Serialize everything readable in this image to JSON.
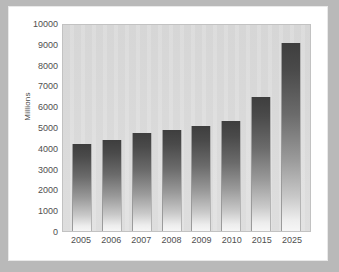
{
  "chart_data": {
    "type": "bar",
    "title": "",
    "xlabel": "",
    "ylabel": "Millions",
    "categories": [
      "2005",
      "2006",
      "2007",
      "2008",
      "2009",
      "2010",
      "2015",
      "2025"
    ],
    "values": [
      4200,
      4400,
      4750,
      4900,
      5120,
      5350,
      6500,
      9150
    ],
    "ylim": [
      0,
      10000
    ],
    "yticks": [
      10000,
      9000,
      8000,
      7000,
      6000,
      5000,
      4000,
      3000,
      2000,
      1000,
      0
    ],
    "ytick_labels": [
      "10000",
      "9000",
      "8000",
      "7000",
      "6000",
      "5000",
      "4000",
      "3000",
      "2000",
      "1000",
      "0"
    ],
    "grid": false,
    "legend": null,
    "bar_style": "vertical-gradient-dark-to-light",
    "colors": {
      "bar_top": "#3e3e3e",
      "bar_bottom": "#f6f6f6",
      "plot_background": "#d9d9d9",
      "card_background": "#ffffff",
      "frame_background": "#b9b9b9",
      "tick_text": "#4f4f4f"
    }
  }
}
